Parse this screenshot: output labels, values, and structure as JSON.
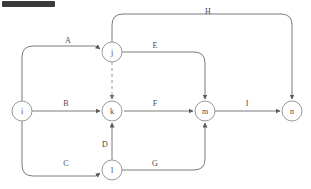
{
  "diagram": {
    "type": "activity-on-arrow-network",
    "title_bar": {
      "present": true,
      "color": "#3a3a3c"
    },
    "colors": {
      "edge": "#7a7a7a",
      "dummy_edge": "#9a9a9a",
      "node_stroke": "#9a9a9a",
      "node_fill": "#ffffff",
      "text": "#4a4a4a",
      "background": "#ffffff"
    },
    "nodes": [
      {
        "id": "i",
        "label": "i",
        "cx": 22,
        "cy": 111,
        "r": 10
      },
      {
        "id": "j",
        "label": "j",
        "cx": 112,
        "cy": 52,
        "r": 10
      },
      {
        "id": "k",
        "label": "k",
        "cx": 112,
        "cy": 111,
        "r": 10
      },
      {
        "id": "l",
        "label": "l",
        "cx": 112,
        "cy": 170,
        "r": 10
      },
      {
        "id": "m",
        "label": "m",
        "cx": 205,
        "cy": 111,
        "r": 10
      },
      {
        "id": "n",
        "label": "n",
        "cx": 292,
        "cy": 111,
        "r": 10
      }
    ],
    "edges": [
      {
        "id": "A",
        "label": "A",
        "from": "i",
        "to": "j",
        "style": "solid",
        "path": "M 22 101 L 22 57 Q 22 46 33 46 L 96 46 L 100 49",
        "label_x": 68,
        "label_y": 40
      },
      {
        "id": "B",
        "label": "B",
        "from": "i",
        "to": "k",
        "style": "solid",
        "path": "M 32 111 L 100 111",
        "label_x": 66,
        "label_y": 103
      },
      {
        "id": "C",
        "label": "C",
        "from": "i",
        "to": "l",
        "style": "solid",
        "path": "M 22 121 L 22 165 Q 22 176 33 176 L 96 176 L 100 173",
        "label_x": 66,
        "label_y": 163
      },
      {
        "id": "D",
        "label": "D",
        "from": "l",
        "to": "k",
        "style": "solid",
        "path": "M 112 160 L 112 123",
        "label_x": 105,
        "label_y": 144
      },
      {
        "id": "E",
        "label": "E",
        "from": "j",
        "to": "m",
        "style": "solid",
        "path": "M 122 52 L 194 52 Q 205 52 205 63 L 205 99",
        "label_x": 155,
        "label_y": 45
      },
      {
        "id": "F",
        "label": "F",
        "from": "k",
        "to": "m",
        "style": "solid",
        "path": "M 124 111 L 193 111",
        "label_x": 155,
        "label_y": 103
      },
      {
        "id": "G",
        "label": "G",
        "from": "l",
        "to": "m",
        "style": "solid",
        "path": "M 122 170 L 194 170 Q 205 170 205 159 L 205 123",
        "label_x": 155,
        "label_y": 163
      },
      {
        "id": "H",
        "label": "H",
        "from": "j",
        "to": "n",
        "style": "solid",
        "path": "M 112 42 L 112 25 Q 112 14 123 14 L 281 14 Q 292 14 292 25 L 292 99",
        "label_x": 208,
        "label_y": 11
      },
      {
        "id": "I",
        "label": "I",
        "from": "m",
        "to": "n",
        "style": "solid",
        "path": "M 215 111 L 280 111",
        "label_x": 247,
        "label_y": 103
      },
      {
        "id": "dummy",
        "label": "",
        "from": "j",
        "to": "k",
        "style": "dashed",
        "path": "M 112 62 L 112 99",
        "label_x": null,
        "label_y": null
      }
    ]
  }
}
